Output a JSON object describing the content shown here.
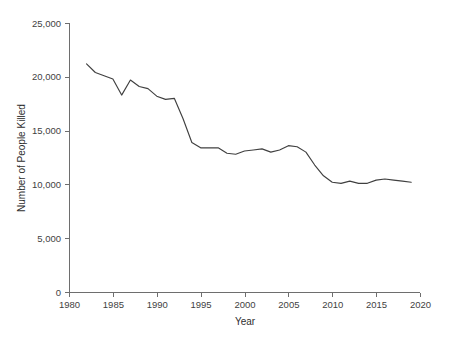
{
  "chart_data": {
    "type": "line",
    "title": "",
    "xlabel": "Year",
    "ylabel": "Number of People Killed",
    "xlim": [
      1980,
      2020
    ],
    "ylim": [
      0,
      25000
    ],
    "grid": false,
    "legend": false,
    "legend_position": "none",
    "x_ticks": [
      1980,
      1985,
      1990,
      1995,
      2000,
      2005,
      2010,
      2015,
      2020
    ],
    "x_tick_labels": [
      "1980",
      "1985",
      "1990",
      "1995",
      "2000",
      "2005",
      "2010",
      "2015",
      "2020"
    ],
    "y_ticks": [
      0,
      5000,
      10000,
      15000,
      20000,
      25000
    ],
    "y_tick_labels": [
      "0",
      "5,000",
      "10,000",
      "15,000",
      "20,000",
      "25,000"
    ],
    "line_color": "#404040",
    "axis_color": "#6e6e6e",
    "x": [
      1982,
      1983,
      1984,
      1985,
      1986,
      1987,
      1988,
      1989,
      1990,
      1991,
      1992,
      1993,
      1994,
      1995,
      1996,
      1997,
      1998,
      1999,
      2000,
      2001,
      2002,
      2003,
      2004,
      2005,
      2006,
      2007,
      2008,
      2009,
      2010,
      2011,
      2012,
      2013,
      2014,
      2015,
      2016,
      2017,
      2018,
      2019
    ],
    "values": [
      21200,
      20400,
      20100,
      19800,
      18300,
      19700,
      19100,
      18900,
      18200,
      17900,
      18000,
      16100,
      13900,
      13400,
      13400,
      13400,
      12900,
      12800,
      13100,
      13200,
      13300,
      13000,
      13200,
      13600,
      13500,
      13000,
      11800,
      10800,
      10200,
      10100,
      10300,
      10100,
      10100,
      10400,
      10500,
      10400,
      10300,
      10200
    ],
    "series": [
      {
        "name": "Number of People Killed",
        "values": [
          21200,
          20400,
          20100,
          19800,
          18300,
          19700,
          19100,
          18900,
          18200,
          17900,
          18000,
          16100,
          13900,
          13400,
          13400,
          13400,
          12900,
          12800,
          13100,
          13200,
          13300,
          13000,
          13200,
          13600,
          13500,
          13000,
          11800,
          10800,
          10200,
          10100,
          10300,
          10100,
          10100,
          10400,
          10500,
          10400,
          10300,
          10200
        ]
      }
    ]
  },
  "figure": {
    "plot_left_px": 69,
    "plot_right_px": 420,
    "plot_top_px": 23,
    "plot_bottom_px": 292
  }
}
